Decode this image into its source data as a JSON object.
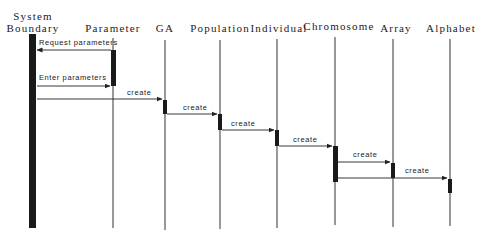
{
  "diagram": {
    "type": "sequence",
    "participants": [
      {
        "id": "system",
        "label_line1": "System",
        "label_line2": "Boundary",
        "x": 33
      },
      {
        "id": "parameter",
        "label": "Parameter",
        "x": 113
      },
      {
        "id": "ga",
        "label": "GA",
        "x": 165
      },
      {
        "id": "population",
        "label": "Population",
        "x": 220
      },
      {
        "id": "individual",
        "label": "Individual",
        "x": 277
      },
      {
        "id": "chromosome",
        "label": "Chromosome",
        "x": 335
      },
      {
        "id": "array",
        "label": "Array",
        "x": 393
      },
      {
        "id": "alphabet",
        "label": "Alphabet",
        "x": 450
      }
    ],
    "messages": [
      {
        "from": "parameter",
        "to": "system",
        "label": "Request parameters"
      },
      {
        "from": "system",
        "to": "parameter",
        "label": "Enter parameters"
      },
      {
        "from": "system",
        "to": "ga",
        "label": "create"
      },
      {
        "from": "ga",
        "to": "population",
        "label": "create"
      },
      {
        "from": "population",
        "to": "individual",
        "label": "create"
      },
      {
        "from": "individual",
        "to": "chromosome",
        "label": "create"
      },
      {
        "from": "chromosome",
        "to": "array",
        "label": "create"
      },
      {
        "from": "chromosome",
        "to": "alphabet",
        "label": "create"
      }
    ],
    "colors": {
      "line": "#222222",
      "activation": "#1a1a1a",
      "background": "#ffffff"
    }
  }
}
